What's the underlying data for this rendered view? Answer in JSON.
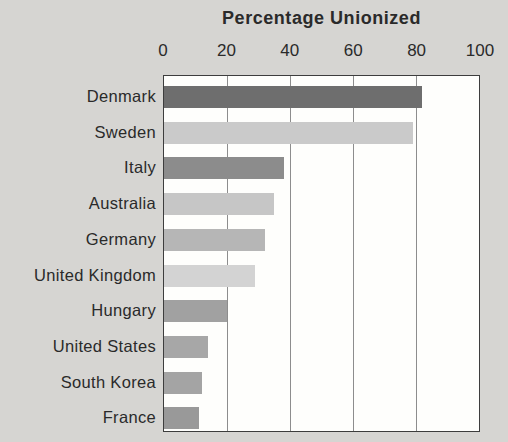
{
  "chart_data": {
    "type": "bar",
    "orientation": "horizontal",
    "title": "Percentage Unionized",
    "categories": [
      "Denmark",
      "Sweden",
      "Italy",
      "Australia",
      "Germany",
      "United Kingdom",
      "Hungary",
      "United States",
      "South Korea",
      "France"
    ],
    "values": [
      82,
      79,
      38,
      35,
      32,
      29,
      20,
      14,
      12,
      11
    ],
    "bar_colors": [
      "#6e6e6e",
      "#cacaca",
      "#8c8c8c",
      "#c6c6c6",
      "#b6b6b6",
      "#d3d3d3",
      "#a1a1a1",
      "#a7a7a7",
      "#a4a4a4",
      "#999999"
    ],
    "x_ticks": [
      "0",
      "20",
      "40",
      "60",
      "80",
      "100"
    ],
    "xlim": [
      0,
      100
    ],
    "axis_position": "top",
    "grid": true,
    "legend": false,
    "xlabel": "",
    "ylabel": ""
  },
  "colors": {
    "page_background": "#d6d5d2",
    "plot_background": "#fefefc",
    "border": "#3d3d3d",
    "gridline": "#8d8d8d",
    "text": "#2a2a2a"
  }
}
